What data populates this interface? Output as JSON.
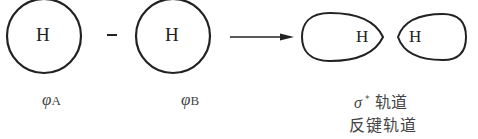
{
  "diagram": {
    "atom_label": "H",
    "operator": "−",
    "orbital_a": {
      "symbol": "φ",
      "subscript": "A"
    },
    "orbital_b": {
      "symbol": "φ",
      "subscript": "B"
    },
    "result": {
      "symbol": "σ",
      "superscript": "*",
      "line1_text": "轨道",
      "line2_text": "反键轨道"
    },
    "colors": {
      "stroke": "#222222",
      "text": "#444444"
    }
  }
}
